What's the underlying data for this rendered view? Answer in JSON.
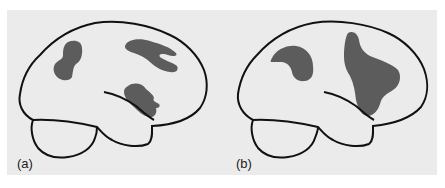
{
  "figure": {
    "background_color": "#ebebeb",
    "outline_color": "#111111",
    "region_color": "#5c5c5c",
    "panels": [
      {
        "id": "a",
        "label": "(a)",
        "description": "Lateral view of brain with three shaded regions: frontal, parietal (forked), and temporal"
      },
      {
        "id": "b",
        "label": "(b)",
        "description": "Lateral view of brain with two shaded regions: frontal (kidney-shaped) and large parietal-temporal"
      }
    ]
  }
}
